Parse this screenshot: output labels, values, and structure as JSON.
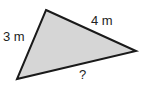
{
  "diagram": {
    "type": "triangle",
    "fill": "#d6d6d6",
    "stroke": "#1a1a1a",
    "vertices": {
      "top": [
        46,
        10
      ],
      "right": [
        136,
        51
      ],
      "bottom_left": [
        17,
        79
      ]
    },
    "sides": {
      "left": "3 m",
      "top_right": "4 m",
      "bottom": "?"
    }
  }
}
